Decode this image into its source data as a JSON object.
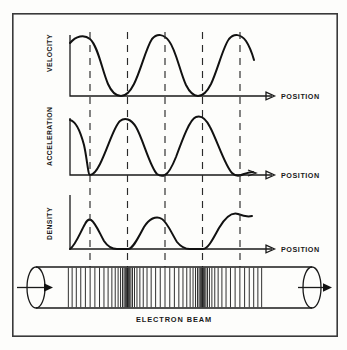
{
  "figure": {
    "title_present": false,
    "frame": {
      "x": 12,
      "y": 13,
      "width": 326,
      "height": 324
    },
    "background_color": "#fdfdfb",
    "ink_color": "#111111"
  },
  "panels": [
    {
      "id": "velocity",
      "y_axis_label": "VELOCITY",
      "x_axis_label": "POSITION",
      "baseline_y": 96,
      "axis_x": 70,
      "axis_x_end": 276,
      "curve_top_y": 35,
      "description": "sinusoid starting near maximum, two full cycles, touching baseline at minima"
    },
    {
      "id": "acceleration",
      "y_axis_label": "ACCELERATION",
      "x_axis_label": "POSITION",
      "baseline_y": 175,
      "axis_x": 70,
      "axis_x_end": 276,
      "curve_top_y": 118,
      "description": "sinusoid starting at maximum, minima touching baseline at dashed lines 1, 3, 5"
    },
    {
      "id": "density",
      "y_axis_label": "DENSITY",
      "x_axis_label": "POSITION",
      "baseline_y": 249,
      "axis_x": 70,
      "axis_x_end": 276,
      "curve_top_y": 195,
      "description": "sinusoid starting at zero, maxima at dashed lines 1, 3, 5 and minima at dashed lines 2 and 4"
    }
  ],
  "dashed_markers": {
    "count": 5,
    "x_positions": [
      90,
      127.5,
      165,
      202.5,
      240
    ],
    "color": "#2a2a2a"
  },
  "tube": {
    "label": "ELECTRON   BEAM",
    "left_x": 36,
    "right_x": 312,
    "top_y": 267,
    "bottom_y": 308,
    "cap_radius_x": 9,
    "inlet_arrow": "arrow-right",
    "outlet_arrow": "arrow-right",
    "bunch_region_start": 66,
    "bunch_region_end": 264,
    "bunch_centers": [
      90,
      165,
      240
    ],
    "stripe_count": 74
  },
  "chart_data": {
    "type": "line",
    "title": "",
    "xlabel": "POSITION",
    "ylabel": "",
    "grid": false,
    "legend": "none",
    "x": [
      0,
      0.25,
      0.5,
      0.75,
      1,
      1.25,
      1.5,
      1.75,
      2,
      2.25,
      2.5
    ],
    "series": [
      {
        "name": "VELOCITY",
        "ylabel": "VELOCITY",
        "values": [
          0.88,
          1.0,
          0.5,
          0.0,
          0.5,
          1.0,
          0.5,
          0.0,
          0.5,
          1.0,
          0.62
        ],
        "ylim": [
          0,
          1
        ]
      },
      {
        "name": "ACCELERATION",
        "ylabel": "ACCELERATION",
        "values": [
          1.0,
          0.5,
          0.0,
          0.5,
          1.0,
          0.5,
          0.0,
          0.5,
          1.0,
          0.5,
          0.0
        ],
        "ylim": [
          0,
          1
        ]
      },
      {
        "name": "DENSITY",
        "ylabel": "DENSITY",
        "values": [
          0.0,
          0.5,
          1.0,
          0.5,
          0.0,
          0.5,
          1.0,
          0.5,
          0.0,
          0.5,
          1.0
        ],
        "ylim": [
          0,
          1
        ]
      }
    ],
    "annotations": [
      "ELECTRON   BEAM"
    ]
  }
}
